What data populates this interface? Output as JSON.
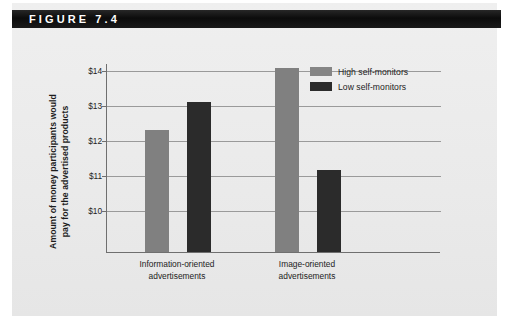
{
  "figure": {
    "header_label": "FIGURE 7.4"
  },
  "chart_data": {
    "type": "bar",
    "title": "",
    "xlabel": "",
    "ylabel": "Amount of money participants would pay for the advertised products",
    "ylabel_lines": [
      "Amount of money participants would",
      "pay for the advertised products"
    ],
    "categories": [
      "Information-oriented advertisements",
      "Image-oriented advertisements"
    ],
    "category_lines": [
      [
        "Information-oriented",
        "advertisements"
      ],
      [
        "Image-oriented",
        "advertisements"
      ]
    ],
    "series": [
      {
        "name": "High self-monitors",
        "color": "#808080",
        "values": [
          12.3,
          14.05
        ]
      },
      {
        "name": "Low self-monitors",
        "color": "#2b2b2b",
        "values": [
          13.1,
          11.15
        ]
      }
    ],
    "ytick_labels": [
      "$14",
      "$13",
      "$12",
      "$11",
      "$10"
    ],
    "ytick_values": [
      14,
      13,
      12,
      11,
      10
    ],
    "ylim": [
      8.8,
      14.2
    ],
    "grid": true,
    "legend_position": "top-right"
  }
}
